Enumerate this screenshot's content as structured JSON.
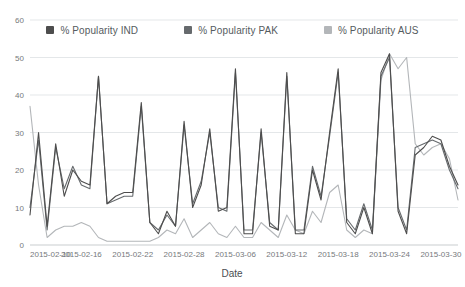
{
  "chart_data": {
    "type": "line",
    "title": "",
    "xlabel": "Date",
    "ylabel": "",
    "ylim": [
      0,
      60
    ],
    "yticks": [
      0,
      10,
      20,
      30,
      40,
      50,
      60
    ],
    "grid": true,
    "legend_position": "top",
    "xtick_labels": [
      "2015-02-10",
      "2015-02-16",
      "2015-02-22",
      "2015-02-28",
      "2015-03-06",
      "2015-03-12",
      "2015-03-18",
      "2015-03-24",
      "2015-03-30"
    ],
    "x": [
      "2015-02-10",
      "2015-02-11",
      "2015-02-12",
      "2015-02-13",
      "2015-02-14",
      "2015-02-15",
      "2015-02-16",
      "2015-02-17",
      "2015-02-18",
      "2015-02-19",
      "2015-02-20",
      "2015-02-21",
      "2015-02-22",
      "2015-02-23",
      "2015-02-24",
      "2015-02-25",
      "2015-02-26",
      "2015-02-27",
      "2015-02-28",
      "2015-03-01",
      "2015-03-02",
      "2015-03-03",
      "2015-03-04",
      "2015-03-05",
      "2015-03-06",
      "2015-03-07",
      "2015-03-08",
      "2015-03-09",
      "2015-03-10",
      "2015-03-11",
      "2015-03-12",
      "2015-03-13",
      "2015-03-14",
      "2015-03-15",
      "2015-03-16",
      "2015-03-17",
      "2015-03-18",
      "2015-03-19",
      "2015-03-20",
      "2015-03-21",
      "2015-03-22",
      "2015-03-23",
      "2015-03-24",
      "2015-03-25",
      "2015-03-26",
      "2015-03-27",
      "2015-03-28",
      "2015-03-29",
      "2015-03-30",
      "2015-03-31",
      "2015-04-01"
    ],
    "series": [
      {
        "name": "% Popularity IND",
        "color": "#4d4d4d",
        "values": [
          8,
          30,
          5,
          27,
          13,
          20,
          17,
          16,
          45,
          11,
          13,
          14,
          14,
          38,
          6,
          3,
          9,
          5,
          33,
          10,
          16,
          31,
          9,
          10,
          47,
          3,
          3,
          31,
          5,
          4,
          46,
          3,
          3,
          20,
          12,
          30,
          47,
          6,
          3,
          10,
          3,
          46,
          51,
          9,
          3,
          24,
          26,
          29,
          28,
          21,
          16
        ]
      },
      {
        "name": "% Popularity PAK",
        "color": "#666a6d",
        "values": [
          10,
          28,
          4,
          26,
          15,
          21,
          16,
          15,
          45,
          11,
          12,
          13,
          13,
          37,
          6,
          4,
          8,
          5,
          32,
          11,
          17,
          30,
          10,
          9,
          46,
          4,
          4,
          30,
          6,
          4,
          45,
          4,
          4,
          21,
          13,
          29,
          46,
          7,
          4,
          11,
          4,
          45,
          50,
          10,
          4,
          26,
          27,
          28,
          27,
          20,
          15
        ]
      },
      {
        "name": "% Popularity AUS",
        "color": "#b3b6b9",
        "values": [
          37,
          16,
          2,
          4,
          5,
          5,
          6,
          5,
          2,
          1,
          1,
          1,
          1,
          1,
          1,
          2,
          4,
          3,
          7,
          2,
          4,
          6,
          3,
          2,
          5,
          2,
          2,
          6,
          4,
          2,
          8,
          4,
          3,
          9,
          6,
          14,
          16,
          4,
          2,
          4,
          3,
          44,
          51,
          47,
          50,
          27,
          24,
          26,
          27,
          23,
          12
        ]
      }
    ]
  },
  "legend": {
    "entries": [
      {
        "label": "% Popularity IND",
        "color": "#4d4d4d"
      },
      {
        "label": "% Popularity PAK",
        "color": "#666a6d"
      },
      {
        "label": "% Popularity AUS",
        "color": "#b3b6b9"
      }
    ]
  },
  "axes": {
    "y_labels": [
      "60",
      "50",
      "40",
      "30",
      "20",
      "10",
      "0"
    ],
    "x_labels": [
      "2015-02-10",
      "2015-02-16",
      "2015-02-22",
      "2015-02-28",
      "2015-03-06",
      "2015-03-12",
      "2015-03-18",
      "2015-03-24",
      "2015-03-30"
    ],
    "x_title": "Date"
  }
}
